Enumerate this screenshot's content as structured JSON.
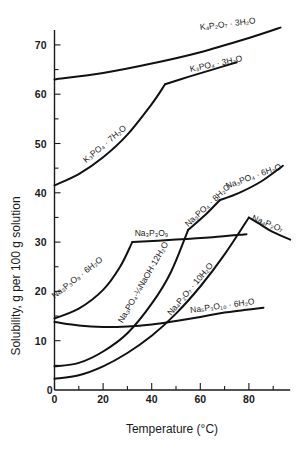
{
  "chart_data": {
    "type": "line",
    "title": "",
    "xlabel": "Temperature (°C)",
    "ylabel": "Solubility, g per 100 g solution",
    "xlim": [
      0,
      97
    ],
    "ylim": [
      0,
      73
    ],
    "x_ticks": [
      0,
      20,
      40,
      60,
      80
    ],
    "x_minor_ticks": [
      10,
      30,
      50,
      70,
      90
    ],
    "y_ticks": [
      0,
      10,
      20,
      30,
      40,
      50,
      60,
      70
    ],
    "y_minor_ticks": [
      5,
      15,
      25,
      35,
      45,
      55,
      65
    ],
    "grid": false,
    "legend": "none (curves labeled inline)",
    "series": [
      {
        "name": "K4P2O7·3H2O",
        "label": "K₄P₂O₇ · 3H₂O",
        "points": [
          [
            0,
            63
          ],
          [
            20,
            64.3
          ],
          [
            40,
            66.2
          ],
          [
            60,
            68.5
          ],
          [
            80,
            71.4
          ],
          [
            93,
            73.5
          ]
        ],
        "label_pos": [
          60,
          73
        ],
        "label_angle": -7
      },
      {
        "name": "K3PO4·7H2O",
        "label": "K₃PO₄ · 7H₂O",
        "points": [
          [
            0,
            41.5
          ],
          [
            10,
            43.8
          ],
          [
            20,
            47.2
          ],
          [
            30,
            51.8
          ],
          [
            40,
            58
          ],
          [
            45.5,
            62
          ]
        ],
        "label_pos": [
          13,
          46
        ],
        "label_angle": -40
      },
      {
        "name": "K3PO4·3H2O",
        "label": "K₃PO₄ · 3H₂O",
        "points": [
          [
            45.5,
            62
          ],
          [
            55,
            63.5
          ],
          [
            65,
            65
          ],
          [
            75,
            66.5
          ]
        ],
        "label_pos": [
          56,
          64.5
        ],
        "label_angle": -12
      },
      {
        "name": "Na3P3O9·6H2O",
        "label": "Na₃P₃O₉ · 6H₂O",
        "points": [
          [
            0,
            14.5
          ],
          [
            10,
            16.5
          ],
          [
            20,
            20.3
          ],
          [
            27,
            25
          ],
          [
            32,
            30
          ]
        ],
        "label_pos": [
          0,
          18.5
        ],
        "label_angle": -38
      },
      {
        "name": "Na3P3O9",
        "label": "Na₃P₃O₉",
        "points": [
          [
            32,
            30
          ],
          [
            50,
            30.5
          ],
          [
            65,
            31
          ],
          [
            79,
            31.6
          ]
        ],
        "label_pos": [
          33,
          31.2
        ],
        "label_angle": 0
      },
      {
        "name": "Na3PO4·1/4NaOH·12H2O",
        "label": "Na₃PO₄·¼NaOH·12H₂O",
        "points": [
          [
            0,
            4.8
          ],
          [
            10,
            5.5
          ],
          [
            20,
            7.8
          ],
          [
            30,
            11.5
          ],
          [
            40,
            17.5
          ],
          [
            48,
            24
          ],
          [
            55,
            32.5
          ]
        ],
        "label_pos": [
          28,
          13.5
        ],
        "label_angle": -60
      },
      {
        "name": "Na3PO4·8H2O",
        "label": "Na₃PO₄ · 8H₂O",
        "points": [
          [
            55,
            32.5
          ],
          [
            62,
            35.5
          ],
          [
            68,
            38.5
          ]
        ],
        "label_pos": [
          55,
          33
        ],
        "label_angle": -43
      },
      {
        "name": "Na3PO4·6H2O",
        "label": "Na₃PO₄ · 6H₂O",
        "points": [
          [
            68,
            38.5
          ],
          [
            76,
            40
          ],
          [
            85,
            42.3
          ],
          [
            94,
            45.5
          ]
        ],
        "label_pos": [
          71,
          40.8
        ],
        "label_angle": -20
      },
      {
        "name": "Na4P2O7·10H2O",
        "label": "Na₄P₂O₇ · 10H₂O",
        "points": [
          [
            0,
            2.3
          ],
          [
            10,
            3
          ],
          [
            20,
            4.8
          ],
          [
            30,
            7.5
          ],
          [
            40,
            11
          ],
          [
            50,
            15.5
          ],
          [
            60,
            21
          ],
          [
            70,
            27.5
          ],
          [
            80,
            35
          ]
        ],
        "label_pos": [
          48,
          15
        ],
        "label_angle": -50
      },
      {
        "name": "Na4P2O7",
        "label": "Na₄P₂O₇",
        "points": [
          [
            80,
            35
          ],
          [
            85,
            33.5
          ],
          [
            90,
            32
          ],
          [
            97,
            30.5
          ]
        ],
        "label_pos": [
          81,
          34.5
        ],
        "label_angle": 22
      },
      {
        "name": "Na5P3O10·6H2O",
        "label": "Na₅P₃O₁₀ · 6H₂O",
        "points": [
          [
            0,
            13.8
          ],
          [
            10,
            13.1
          ],
          [
            20,
            12.8
          ],
          [
            30,
            12.9
          ],
          [
            40,
            13.3
          ],
          [
            50,
            14
          ],
          [
            60,
            14.8
          ],
          [
            70,
            15.7
          ],
          [
            86,
            16.7
          ]
        ],
        "label_pos": [
          56,
          15.6
        ],
        "label_angle": -8
      }
    ]
  }
}
